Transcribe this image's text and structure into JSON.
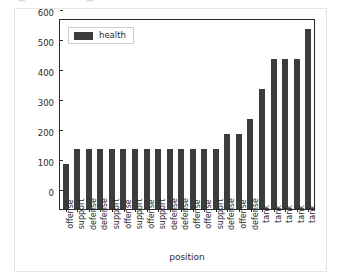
{
  "figure": {
    "top_strip_glyphs": [
      "▬",
      "·",
      "·",
      "·",
      "▬",
      "·"
    ]
  },
  "chart_data": {
    "type": "bar",
    "title": "",
    "xlabel": "position",
    "ylabel": "",
    "ylim": [
      0,
      630
    ],
    "yticks": [
      0,
      100,
      200,
      300,
      400,
      500,
      600
    ],
    "ytick_labels": [
      "0",
      "100",
      "200",
      "300",
      "400",
      "500",
      "600"
    ],
    "grid": false,
    "legend": {
      "position": "upper left",
      "entries": [
        {
          "label": "health",
          "color": "#3c3c3c"
        }
      ]
    },
    "series": [
      {
        "name": "health",
        "color": "#3c3c3c",
        "values": [
          150,
          200,
          200,
          200,
          200,
          200,
          200,
          200,
          200,
          200,
          200,
          200,
          200,
          200,
          250,
          250,
          300,
          400,
          500,
          500,
          500,
          600
        ]
      }
    ],
    "categories": [
      "offense",
      "support",
      "defense",
      "defense",
      "support",
      "offense",
      "support",
      "offense",
      "support",
      "defense",
      "defense",
      "offense",
      "offense",
      "support",
      "defense",
      "offense",
      "defense",
      "tank",
      "tank",
      "tank",
      "tank",
      "tank"
    ]
  }
}
